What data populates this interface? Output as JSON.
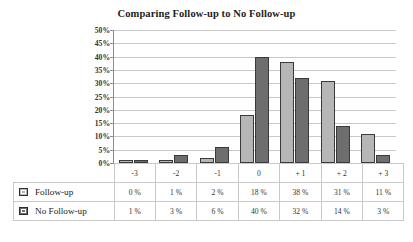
{
  "chart_data": {
    "type": "bar",
    "title": "Comparing Follow-up to No Follow-up",
    "xlabel": "",
    "ylabel": "",
    "ylim": [
      0,
      50
    ],
    "ytick_labels": [
      "50%",
      "45%",
      "40%",
      "35%",
      "30%",
      "25%",
      "20%",
      "15%",
      "10%",
      "5%",
      "0%"
    ],
    "ytick_values": [
      50,
      45,
      40,
      35,
      30,
      25,
      20,
      15,
      10,
      5,
      0
    ],
    "grid": true,
    "legend_position": "bottom-table",
    "categories": [
      "-3",
      "-2",
      "-1",
      "0",
      "+ 1",
      "+ 2",
      "+ 3"
    ],
    "series": [
      {
        "name": "Follow-up",
        "color": "#b6b6b6",
        "values": [
          0,
          1,
          2,
          18,
          38,
          31,
          11
        ],
        "labels": [
          "0 %",
          "1 %",
          "2 %",
          "18 %",
          "38 %",
          "31 %",
          "11 %"
        ]
      },
      {
        "name": "No Follow-up",
        "color": "#6e6e6e",
        "values": [
          1,
          3,
          6,
          40,
          32,
          14,
          3
        ],
        "labels": [
          "1 %",
          "3 %",
          "6 %",
          "40 %",
          "32 %",
          "14 %",
          "3 %"
        ]
      }
    ]
  },
  "colors": {
    "series_a": "#b6b6b6",
    "series_b": "#6e6e6e",
    "gridline": "#c8c8c8",
    "axis": "#8d8d8d",
    "table_border": "#c9c9c9",
    "text": "#333333",
    "background": "#ffffff"
  }
}
